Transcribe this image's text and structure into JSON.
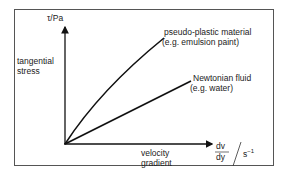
{
  "diagram": {
    "type": "flow-curve",
    "y_axis": {
      "unit_label": "τ/Pa",
      "description_line1": "tangential",
      "description_line2": "stress"
    },
    "x_axis": {
      "unit_numerator": "dv",
      "unit_denominator": "dy",
      "unit_suffix": "s",
      "unit_exponent": "−1",
      "description_line1": "velocity",
      "description_line2": "gradient"
    },
    "curves": [
      {
        "name": "pseudo-plastic material",
        "example": "(e.g. emulsion paint)",
        "shape": "concave-down curve"
      },
      {
        "name": "Newtonian fluid",
        "example": "(e.g. water)",
        "shape": "straight line"
      }
    ],
    "colors": {
      "line": "#111111",
      "frame": "#555555",
      "background": "#ffffff"
    }
  }
}
